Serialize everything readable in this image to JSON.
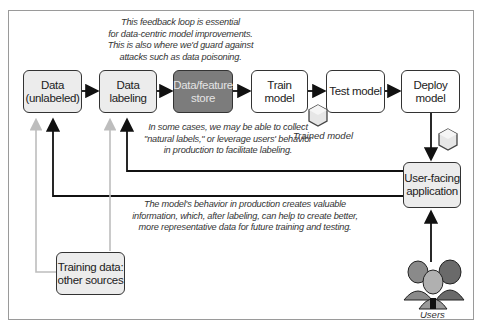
{
  "diagram": {
    "top_note": "This feedback loop is essential\nfor data-centric model improvements.\nThis is also where we'd guard against\nattacks such as data poisoning.",
    "nodes": {
      "data_unlabeled": "Data\n(unlabeled)",
      "data_labeling": "Data\nlabeling",
      "feature_store": "Data/feature\nstore",
      "train_model": "Train model",
      "test_model": "Test model",
      "deploy_model": "Deploy\nmodel",
      "user_facing_app": "User-facing\napplication",
      "training_other": "Training data:\nother sources"
    },
    "artifacts": {
      "trained_model_label": "Trained model",
      "users_label": "Users"
    },
    "middle_note": "In some cases, we may be able to collect\n\"natural labels,\" or leverage users' behavior\nin production to facilitate labeling.",
    "bottom_note": "The model's behavior in production creates valuable\ninformation, which, after labeling, can help to create better,\nmore representative data for future training and testing.",
    "colors": {
      "light_box": "#ececec",
      "dark_box": "#7c7c7c",
      "gray_line": "#bdbdbd",
      "line": "#111111"
    }
  }
}
